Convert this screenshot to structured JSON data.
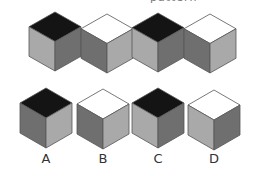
{
  "header": {
    "fragment": "pattern"
  },
  "colors": {
    "black": "#141414",
    "white": "#ffffff",
    "light": "#a9a9a9",
    "dark": "#6f6f6f",
    "edge": "#555555"
  },
  "sequence": [
    {
      "top": "black",
      "left": "light",
      "right": "dark"
    },
    {
      "top": "white",
      "left": "dark",
      "right": "light"
    },
    {
      "top": "black",
      "left": "light",
      "right": "dark"
    },
    {
      "top": "white",
      "left": "dark",
      "right": "light"
    }
  ],
  "options": [
    {
      "label": "A",
      "top": "black",
      "left": "dark",
      "right": "light"
    },
    {
      "label": "B",
      "top": "white",
      "left": "dark",
      "right": "light"
    },
    {
      "label": "C",
      "top": "black",
      "left": "light",
      "right": "dark"
    },
    {
      "label": "D",
      "top": "white",
      "left": "light",
      "right": "dark"
    }
  ]
}
